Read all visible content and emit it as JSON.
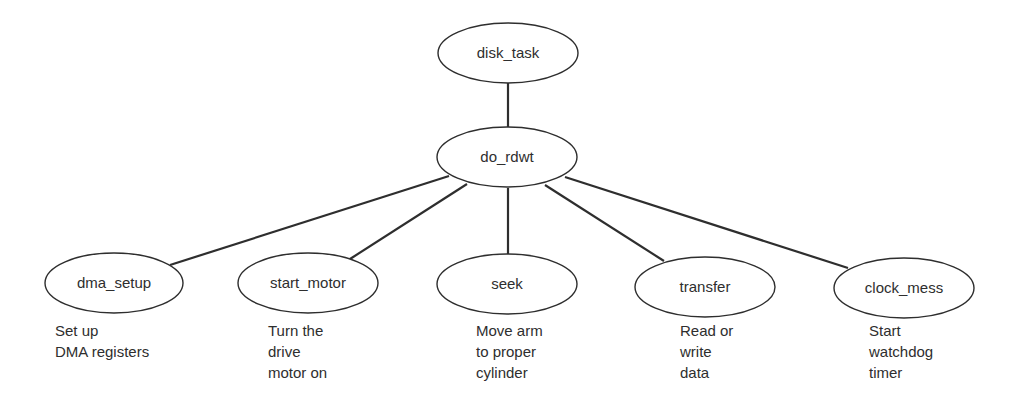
{
  "diagram": {
    "root": {
      "id": "disk_task",
      "label": "disk_task",
      "cx": 508,
      "cy": 53,
      "rx": 70,
      "ry": 30
    },
    "hub": {
      "id": "do_rdwt",
      "label": "do_rdwt",
      "cx": 507,
      "cy": 157,
      "rx": 70,
      "ry": 30
    },
    "children": [
      {
        "id": "dma_setup",
        "label": "dma_setup",
        "cx": 114,
        "cy": 283,
        "rx": 69,
        "ry": 30,
        "caption": [
          "Set up",
          "DMA registers"
        ],
        "caption_x": 55,
        "caption_y": 320
      },
      {
        "id": "start_motor",
        "label": "start_motor",
        "cx": 308,
        "cy": 283,
        "rx": 70,
        "ry": 30,
        "caption": [
          "Turn the",
          "drive",
          "motor on"
        ],
        "caption_x": 268,
        "caption_y": 320
      },
      {
        "id": "seek",
        "label": "seek",
        "cx": 507,
        "cy": 284,
        "rx": 70,
        "ry": 30,
        "caption": [
          "Move arm",
          "to proper",
          "cylinder"
        ],
        "caption_x": 476,
        "caption_y": 320
      },
      {
        "id": "transfer",
        "label": "transfer",
        "cx": 705,
        "cy": 287,
        "rx": 70,
        "ry": 30,
        "caption": [
          "Read or",
          "write",
          "data"
        ],
        "caption_x": 680,
        "caption_y": 320
      },
      {
        "id": "clock_mess",
        "label": "clock_mess",
        "cx": 904,
        "cy": 288,
        "rx": 70,
        "ry": 30,
        "caption": [
          "Start",
          "watchdog",
          "timer"
        ],
        "caption_x": 869,
        "caption_y": 320
      }
    ],
    "edges": [
      {
        "from": "disk_task",
        "to": "do_rdwt",
        "x1": 508,
        "y1": 83,
        "x2": 508,
        "y2": 127
      },
      {
        "from": "do_rdwt",
        "to": "dma_setup",
        "x1": 449,
        "y1": 176,
        "x2": 170,
        "y2": 265
      },
      {
        "from": "do_rdwt",
        "to": "start_motor",
        "x1": 467,
        "y1": 184,
        "x2": 350,
        "y2": 259
      },
      {
        "from": "do_rdwt",
        "to": "seek",
        "x1": 508,
        "y1": 188,
        "x2": 508,
        "y2": 254
      },
      {
        "from": "do_rdwt",
        "to": "transfer",
        "x1": 545,
        "y1": 185,
        "x2": 664,
        "y2": 261
      },
      {
        "from": "do_rdwt",
        "to": "clock_mess",
        "x1": 565,
        "y1": 177,
        "x2": 848,
        "y2": 268
      }
    ]
  }
}
